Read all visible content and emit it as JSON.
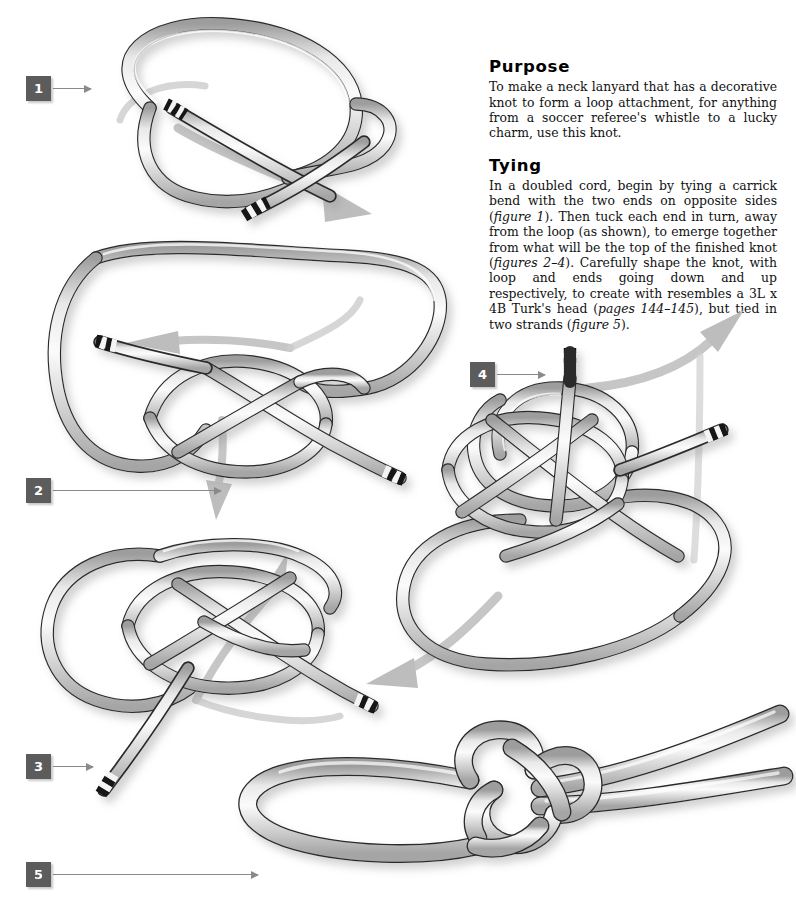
{
  "page": {
    "width": 796,
    "height": 910,
    "background": "#ffffff"
  },
  "text": {
    "purpose": {
      "heading": "Purpose",
      "body": "To make a neck lanyard that has a decorative knot to form a loop attachment, for anything from a soccer referee's whistle to a lucky charm, use this knot."
    },
    "tying": {
      "heading": "Tying",
      "body_part1": "In a doubled cord, begin by tying a carrick bend with the two ends on opposite sides (",
      "ital1": "figure 1",
      "body_part2": "). Then tuck each end in turn, away from the loop (as shown), to emerge together from what will be the top of the finished knot (",
      "ital2": "figures 2–4",
      "body_part3": "). Carefully shape the knot, with loop and ends going down and up respectively, to create with resembles a 3L x 4B Turk's head (",
      "ital3": "pages 144–145",
      "body_part4": "), but tied in two strands (",
      "ital4": "figure 5",
      "body_part5": ")."
    }
  },
  "figures": [
    {
      "id": 1,
      "label": "1",
      "caption": "carrick bend with two ends on opposite sides"
    },
    {
      "id": 2,
      "label": "2",
      "caption": "first end tucked away from the loop"
    },
    {
      "id": 3,
      "label": "3",
      "caption": "second end tucked, both ends emerging"
    },
    {
      "id": 4,
      "label": "4",
      "caption": "ends emerge together at top of knot"
    },
    {
      "id": 5,
      "label": "5",
      "caption": "finished lanyard knot with loop and two tails"
    }
  ],
  "markers": [
    {
      "label": "1",
      "x": 26,
      "y": 76,
      "leader_x": 53,
      "leader_y": 88,
      "leader_w": 38
    },
    {
      "label": "2",
      "x": 26,
      "y": 478,
      "leader_x": 53,
      "leader_y": 490,
      "leader_w": 168
    },
    {
      "label": "3",
      "x": 26,
      "y": 754,
      "leader_x": 53,
      "leader_y": 766,
      "leader_w": 40
    },
    {
      "label": "4",
      "x": 470,
      "y": 362,
      "leader_x": 497,
      "leader_y": 374,
      "leader_w": 48
    },
    {
      "label": "5",
      "x": 26,
      "y": 862,
      "leader_x": 53,
      "leader_y": 874,
      "leader_w": 205
    }
  ],
  "colors": {
    "cord_fill": "#d6d6d6",
    "cord_highlight": "#f2f2f2",
    "cord_outline": "#2a2a2a",
    "whipping_dark": "#121212",
    "whipping_light": "#ffffff",
    "arrow_gray": "#bdbdbd",
    "marker_box": "#5c5c5c",
    "marker_text": "#ffffff",
    "leader_line": "#8a8a8a",
    "text_color": "#111111",
    "shadow": "rgba(120,120,120,0.35)"
  },
  "arrows": [
    {
      "name": "fig1-motion-arrow",
      "from": "figure 1 loop",
      "direction": "down-right"
    },
    {
      "name": "fig2-tuck-arrow-left",
      "from": "figure 2 end",
      "direction": "left"
    },
    {
      "name": "fig2-motion-arrow",
      "from": "figure 2 knot",
      "direction": "down"
    },
    {
      "name": "fig3-motion-arrow",
      "from": "figure 3 knot",
      "direction": "up-right"
    },
    {
      "name": "fig4-to-fig3-arrow",
      "from": "figure 4",
      "direction": "down-left"
    },
    {
      "name": "fig4-to-fig5-arrow",
      "from": "figure 4",
      "direction": "up-right"
    }
  ]
}
